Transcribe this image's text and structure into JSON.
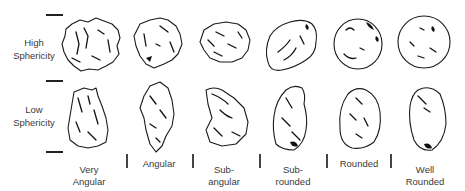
{
  "figure": {
    "rows": [
      {
        "id": "high",
        "label": "High\nSphericity"
      },
      {
        "id": "low",
        "label": "Low\nSphericity"
      }
    ],
    "columns": [
      {
        "id": "very-angular",
        "label": "Very\nAngular"
      },
      {
        "id": "angular",
        "label": "Angular"
      },
      {
        "id": "sub-angular",
        "label": "Sub-\nangular"
      },
      {
        "id": "sub-rounded",
        "label": "Sub-\nrounded"
      },
      {
        "id": "rounded",
        "label": "Rounded"
      },
      {
        "id": "well-rounded",
        "label": "Well\nRounded"
      }
    ],
    "grain_count": 12,
    "colors": {
      "outline": "#1a1a1a",
      "text": "#3a3a3a",
      "background": "#ffffff"
    }
  }
}
